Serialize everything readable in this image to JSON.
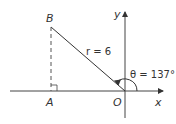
{
  "diagram": {
    "points": {
      "B": "B",
      "A": "A",
      "O": "O"
    },
    "axes": {
      "x_label": "x",
      "y_label": "y"
    },
    "radius_label": "r = 6",
    "angle_label": "θ = 137°",
    "colors": {
      "line": "#333333",
      "axis": "#444444"
    }
  }
}
